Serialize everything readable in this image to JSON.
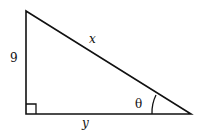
{
  "diagram": {
    "type": "right-triangle",
    "labels": {
      "vertical_leg": "9",
      "hypotenuse": "x",
      "horizontal_leg": "y",
      "angle": "θ"
    },
    "right_angle_marker": true
  }
}
